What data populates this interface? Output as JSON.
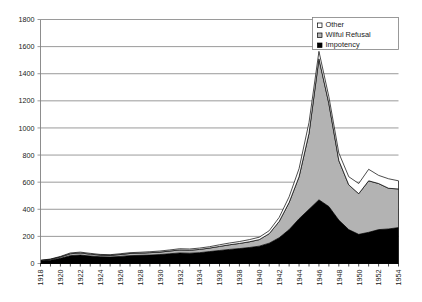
{
  "chart_data": {
    "type": "area",
    "stacked": true,
    "title": "",
    "subtitle": "",
    "xlabel": "",
    "ylabel": "",
    "xlim": [
      1918,
      1954
    ],
    "ylim": [
      0,
      1800
    ],
    "ytick_step": 200,
    "xtick_step": 2,
    "grid": true,
    "grid_axis": "y",
    "legend_position": "top-right",
    "x": [
      1918,
      1919,
      1920,
      1921,
      1922,
      1923,
      1924,
      1925,
      1926,
      1927,
      1928,
      1929,
      1930,
      1931,
      1932,
      1933,
      1934,
      1935,
      1936,
      1937,
      1938,
      1939,
      1940,
      1941,
      1942,
      1943,
      1944,
      1945,
      1946,
      1947,
      1948,
      1949,
      1950,
      1951,
      1952,
      1953,
      1954
    ],
    "xticks": [
      "1918",
      "1920",
      "1922",
      "1924",
      "1926",
      "1928",
      "1930",
      "1932",
      "1934",
      "1936",
      "1938",
      "1940",
      "1942",
      "1944",
      "1946",
      "1948",
      "1950",
      "1952",
      "1954"
    ],
    "yticks": [
      "0",
      "200",
      "400",
      "600",
      "800",
      "1000",
      "1200",
      "1400",
      "1600",
      "1800"
    ],
    "series": [
      {
        "name": "Impotency",
        "color": "#000000",
        "values": [
          18,
          24,
          38,
          58,
          62,
          55,
          50,
          48,
          52,
          58,
          60,
          62,
          66,
          72,
          78,
          76,
          80,
          88,
          96,
          104,
          110,
          118,
          128,
          150,
          190,
          250,
          330,
          400,
          470,
          420,
          320,
          250,
          215,
          230,
          250,
          255,
          265
        ]
      },
      {
        "name": "Wilful Refusal",
        "color": "#b3b3b3",
        "values": [
          4,
          6,
          10,
          14,
          16,
          14,
          12,
          12,
          14,
          16,
          16,
          18,
          18,
          20,
          22,
          22,
          24,
          26,
          30,
          34,
          38,
          42,
          48,
          70,
          120,
          200,
          310,
          560,
          1040,
          760,
          440,
          330,
          300,
          380,
          340,
          300,
          285
        ]
      },
      {
        "name": "Other",
        "color": "#ffffff",
        "values": [
          2,
          3,
          4,
          6,
          6,
          6,
          5,
          5,
          6,
          6,
          7,
          7,
          8,
          8,
          9,
          9,
          10,
          10,
          12,
          13,
          14,
          16,
          18,
          22,
          30,
          42,
          60,
          80,
          55,
          50,
          55,
          60,
          75,
          85,
          60,
          70,
          60
        ]
      }
    ]
  },
  "legend": {
    "items": [
      {
        "label": "Other",
        "swatch": "#ffffff",
        "border": "#000000"
      },
      {
        "label": "Wilful Refusal",
        "swatch": "#b3b3b3",
        "border": "#000000"
      },
      {
        "label": "Impotency",
        "swatch": "#000000",
        "border": "#000000"
      }
    ]
  },
  "axes": {
    "gridline_color": "#808080",
    "axis_color": "#808080",
    "series_outline_color": "#000000"
  }
}
